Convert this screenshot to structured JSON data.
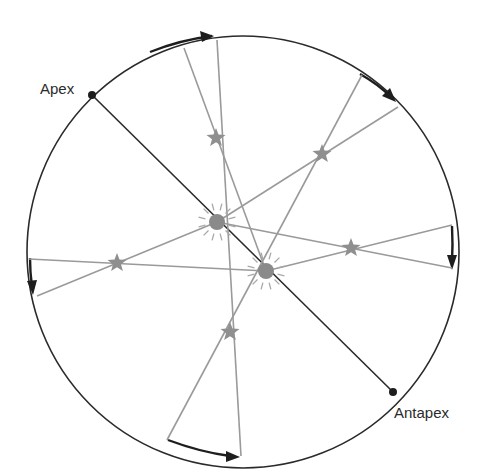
{
  "diagram": {
    "labels": {
      "apex": "Apex",
      "antapex": "Antapex"
    },
    "colors": {
      "circle": "#2a2a2a",
      "axis": "#2a2a2a",
      "sight_lines": "#9a9a9a",
      "stars": "#8f8f8f",
      "sun": "#8a8a8a",
      "markers": "#1e1e1e"
    },
    "elements": {
      "sun_positions": [
        "sun-earlier",
        "sun-later"
      ],
      "star_count": 5,
      "direction_arrows": 6
    }
  }
}
